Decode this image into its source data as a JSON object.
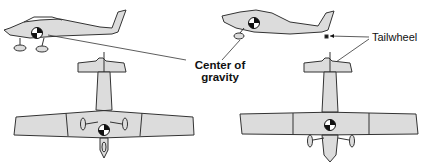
{
  "diagram": {
    "labels": {
      "cg_line1": "Center of",
      "cg_line2": "gravity",
      "tailwheel": "Tailwheel"
    },
    "panels": [
      {
        "name": "tricycle-gear",
        "views": [
          "side",
          "top"
        ]
      },
      {
        "name": "conventional-tailwheel-gear",
        "views": [
          "side",
          "top"
        ]
      }
    ],
    "colors": {
      "fill": "#dcdcdc",
      "stroke": "#333333",
      "background": "#ffffff"
    }
  }
}
